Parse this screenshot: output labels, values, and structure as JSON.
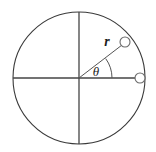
{
  "diagram": {
    "type": "geometry-polar-coordinate",
    "background_color": "#ffffff",
    "stroke_color": "#3a3a3a",
    "marker_fill": "#ffffff",
    "marker_stroke": "#6a6a6a",
    "labels": {
      "radius": "r",
      "angle": "θ"
    },
    "geometry": {
      "center": {
        "x": 79,
        "y": 78
      },
      "radius": 66,
      "angle_degrees": 36,
      "angle_arc_radius": 33,
      "horizontal_axis": {
        "x1": 13,
        "y1": 78,
        "x2": 145,
        "y2": 78
      },
      "vertical_axis": {
        "x1": 79,
        "y1": 12,
        "x2": 79,
        "y2": 144
      },
      "radius_line": {
        "x1": 79,
        "y1": 78,
        "x2": 122,
        "y2": 45
      },
      "point_on_radius": {
        "x": 125,
        "y": 42,
        "r": 5
      },
      "point_on_axis": {
        "x": 140,
        "y": 78,
        "r": 5
      }
    },
    "label_positions": {
      "radius": {
        "x": 107,
        "y": 46
      },
      "angle": {
        "x": 96,
        "y": 76
      }
    }
  }
}
